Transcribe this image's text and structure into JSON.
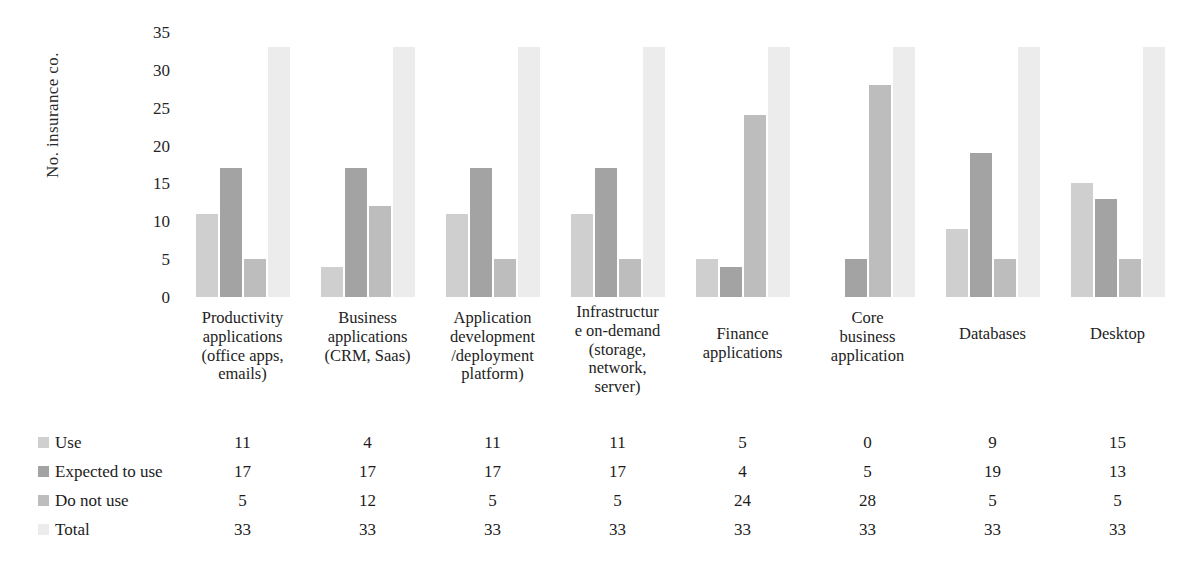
{
  "chart_data": {
    "type": "bar",
    "title": "",
    "xlabel": "",
    "ylabel": "No. insurance co.",
    "ylim": [
      0,
      35
    ],
    "yticks": [
      35,
      30,
      25,
      20,
      15,
      10,
      5,
      0
    ],
    "grid": false,
    "legend_position": "bottom-table",
    "categories": [
      "Productivity applications (office apps, emails)",
      "Business applications (CRM, Saas)",
      "Application development /deployment platform)",
      "Infrastructure on-demand (storage, network, server)",
      "Finance applications",
      "Core business application",
      "Databases",
      "Desktop"
    ],
    "category_lines": [
      [
        "Productivity",
        "applications",
        "(office apps,",
        "emails)"
      ],
      [
        "Business",
        "applications",
        "(CRM, Saas)"
      ],
      [
        "Application",
        "development",
        "/deployment",
        "platform)"
      ],
      [
        "Infrastructur",
        "e on-demand",
        "(storage,",
        "network,",
        "server)"
      ],
      [
        "Finance",
        "applications"
      ],
      [
        "Core",
        "business",
        "application"
      ],
      [
        "Databases"
      ],
      [
        "Desktop"
      ]
    ],
    "series": [
      {
        "name": "Use",
        "color": "#cfcfcf",
        "values": [
          11,
          4,
          11,
          11,
          5,
          0,
          9,
          15
        ]
      },
      {
        "name": "Expected to use",
        "color": "#a3a3a3",
        "values": [
          17,
          17,
          17,
          17,
          4,
          5,
          19,
          13
        ]
      },
      {
        "name": "Do not use",
        "color": "#bdbdbd",
        "values": [
          5,
          12,
          5,
          5,
          24,
          28,
          5,
          5
        ]
      },
      {
        "name": "Total",
        "color": "#ececec",
        "values": [
          33,
          33,
          33,
          33,
          33,
          33,
          33,
          33
        ]
      }
    ]
  }
}
